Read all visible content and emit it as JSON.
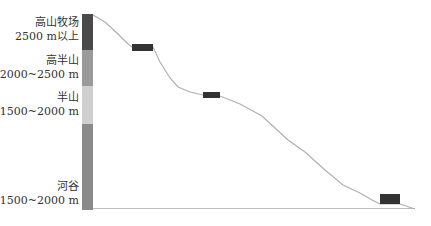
{
  "diagram": {
    "zones": [
      {
        "name": "高山牧场",
        "range": "2500 m以上",
        "color": "#4a4a4a"
      },
      {
        "name": "高半山",
        "range": "2000~2500 m",
        "color": "#9a9a9a"
      },
      {
        "name": "半山",
        "range": "1500~2000 m",
        "color": "#cfcfcf"
      },
      {
        "name": "河谷",
        "range": "1500~2000 m",
        "color": "#8a8a8a"
      }
    ],
    "line_color": "#b0b0b0",
    "block_color": "#333333"
  }
}
